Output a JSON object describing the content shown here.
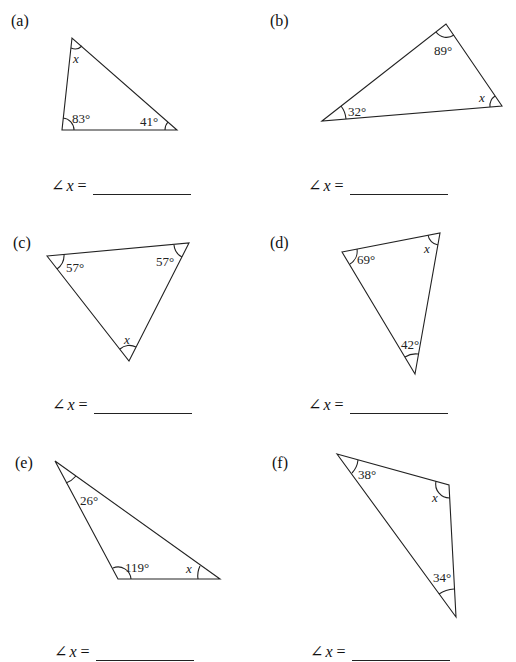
{
  "problems": [
    {
      "id": "a",
      "label": "(a)",
      "angles": [
        "x",
        "83°",
        "41°"
      ],
      "answer_prefix": "∠",
      "answer_var": "x",
      "answer_eq": "="
    },
    {
      "id": "b",
      "label": "(b)",
      "angles": [
        "89°",
        "32°",
        "x"
      ],
      "answer_prefix": "∠",
      "answer_var": "x",
      "answer_eq": "="
    },
    {
      "id": "c",
      "label": "(c)",
      "angles": [
        "57°",
        "57°",
        "x"
      ],
      "answer_prefix": "∠",
      "answer_var": "x",
      "answer_eq": "="
    },
    {
      "id": "d",
      "label": "(d)",
      "angles": [
        "69°",
        "x",
        "42°"
      ],
      "answer_prefix": "∠",
      "answer_var": "x",
      "answer_eq": "="
    },
    {
      "id": "e",
      "label": "(e)",
      "angles": [
        "26°",
        "119°",
        "x"
      ],
      "answer_prefix": "∠",
      "answer_var": "x",
      "answer_eq": "="
    },
    {
      "id": "f",
      "label": "(f)",
      "angles": [
        "38°",
        "x",
        "34°"
      ],
      "answer_prefix": "∠",
      "answer_var": "x",
      "answer_eq": "="
    }
  ]
}
